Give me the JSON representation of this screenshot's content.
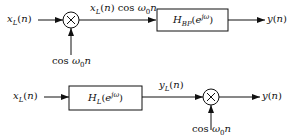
{
  "diagram": {
    "system1": {
      "input": "x_L(n)",
      "multiplier": "×",
      "carrier": "cos ω0 n",
      "intermediate": "x_L(n) cos ω0 n",
      "filter": "H_BP(e^jω)",
      "output": "y(n)"
    },
    "system2": {
      "input": "x_L(n)",
      "filter": "H_L(e^jω)",
      "intermediate": "y_L(n)",
      "multiplier": "×",
      "carrier": "cos ω0 n",
      "output": "y(n)"
    }
  }
}
